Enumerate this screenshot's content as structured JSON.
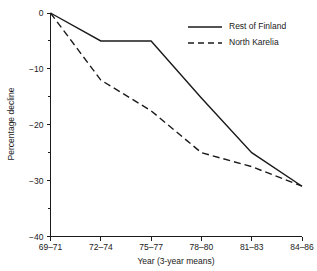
{
  "chart_data": {
    "type": "line",
    "title": "",
    "xlabel": "Year (3-year means)",
    "ylabel": "Percentage decline",
    "categories": [
      "69–71",
      "72–74",
      "75–77",
      "78–80",
      "81–83",
      "84–86"
    ],
    "ylim": [
      -40,
      0
    ],
    "yticks": [
      0,
      -10,
      -20,
      -30,
      -40
    ],
    "ytick_labels": [
      "0",
      "−10",
      "−20",
      "−30",
      "−40"
    ],
    "yminor_ticks": [
      -5,
      -15,
      -25,
      -35
    ],
    "grid": false,
    "legend_position": "top-right",
    "series": [
      {
        "name": "Rest of Finland",
        "style": "solid",
        "color": "#1a1a1a",
        "values": [
          0,
          -5,
          -5,
          -15.2,
          -25,
          -31
        ]
      },
      {
        "name": "North Karelia",
        "style": "dashed",
        "color": "#1a1a1a",
        "values": [
          0,
          -12,
          -17.5,
          -25,
          -27.5,
          -31
        ]
      }
    ]
  },
  "legend": {
    "items": [
      {
        "label": "Rest of Finland",
        "style": "solid"
      },
      {
        "label": "North Karelia",
        "style": "dashed"
      }
    ]
  },
  "axes": {
    "x_title": "Year (3-year means)",
    "y_title": "Percentage decline"
  }
}
